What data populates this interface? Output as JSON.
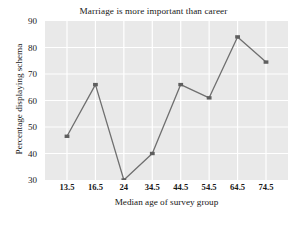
{
  "chart_data": {
    "type": "line",
    "title": "Marriage is more important than career",
    "xlabel": "Median age of survey group",
    "ylabel": "Percentage displaying schema",
    "x_tick_labels": [
      "13.5",
      "16.5",
      "24",
      "34.5",
      "44.5",
      "54.5",
      "64.5",
      "74.5"
    ],
    "categories": [
      13.5,
      16.5,
      24,
      34.5,
      44.5,
      54.5,
      64.5,
      74.5
    ],
    "values": [
      46.5,
      66,
      30,
      40,
      66,
      61,
      84,
      74.5
    ],
    "y_tick_labels": [
      "30",
      "40",
      "50",
      "60",
      "70",
      "80",
      "90"
    ],
    "y_ticks": [
      30,
      40,
      50,
      60,
      70,
      80,
      90
    ],
    "ylim": [
      30,
      90
    ],
    "grid": true,
    "grid_color": "#ffffff",
    "plot_background": "#e9e9e9",
    "line_color": "#6f6f6f",
    "marker_color": "#5f5f5f",
    "marker": "square",
    "legend": "none"
  }
}
